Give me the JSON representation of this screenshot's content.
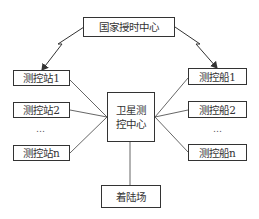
{
  "diagram": {
    "top_node": {
      "label": "国家授时中心"
    },
    "center_node": {
      "line1": "卫星测",
      "line2": "控中心"
    },
    "bottom_node": {
      "label": "着陆场"
    },
    "left_nodes": [
      {
        "label": "测控站1"
      },
      {
        "label": "测控站2"
      },
      {
        "label": "测控站n"
      }
    ],
    "right_nodes": [
      {
        "label": "测控船1"
      },
      {
        "label": "测控船2"
      },
      {
        "label": "测控船n"
      }
    ],
    "ellipsis": "…",
    "edges": [
      {
        "from": "国家授时中心",
        "to": "测控站1",
        "style": "zigzag-arrow"
      },
      {
        "from": "国家授时中心",
        "to": "测控船1",
        "style": "zigzag-arrow"
      },
      {
        "from": "测控站1",
        "to": "卫星测控中心",
        "style": "line"
      },
      {
        "from": "测控站2",
        "to": "卫星测控中心",
        "style": "line"
      },
      {
        "from": "测控站n",
        "to": "卫星测控中心",
        "style": "line"
      },
      {
        "from": "测控船1",
        "to": "卫星测控中心",
        "style": "line"
      },
      {
        "from": "测控船2",
        "to": "卫星测控中心",
        "style": "line"
      },
      {
        "from": "测控船n",
        "to": "卫星测控中心",
        "style": "line"
      },
      {
        "from": "卫星测控中心",
        "to": "着陆场",
        "style": "line"
      }
    ]
  }
}
